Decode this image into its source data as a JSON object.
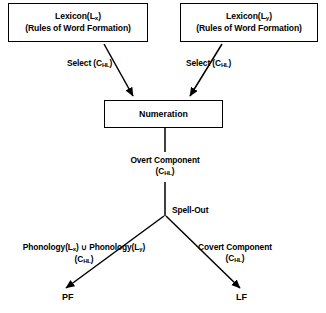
{
  "diagram": {
    "type": "flowchart",
    "background_color": "#ffffff",
    "line_color": "#000000"
  },
  "nodes": {
    "lexicon_x": {
      "line1_prefix": "Lexicon(L",
      "line1_subscript": "x",
      "line1_suffix": ")",
      "line2": "(Rules of Word Formation)"
    },
    "lexicon_y": {
      "line1_prefix": "Lexicon(L",
      "line1_subscript": "y",
      "line1_suffix": ")",
      "line2": "(Rules of Word Formation)"
    },
    "numeration": {
      "label": "Numeration"
    },
    "pf": {
      "label": "PF"
    },
    "lf": {
      "label": "LF"
    }
  },
  "labels": {
    "select_left": {
      "text_prefix": "Select (C",
      "subscript": "HL",
      "text_suffix": ")"
    },
    "select_right": {
      "text_prefix": "Select (C",
      "subscript": "HL",
      "text_suffix": ")"
    },
    "overt_component": {
      "line1": "Overt Component",
      "line2_prefix": "(C",
      "line2_subscript": "HL",
      "line2_suffix": ")"
    },
    "spell_out": {
      "text": "Spell-Out"
    },
    "phonology_union": {
      "line1_part1": "Phonology(L",
      "line1_sub1": "x",
      "line1_part2": ") ",
      "line1_union": "∪",
      "line1_part3": " Phonology(L",
      "line1_sub2": "y",
      "line1_part4": ")",
      "line2_prefix": "(C",
      "line2_subscript": "HL",
      "line2_suffix": ")"
    },
    "covert_component": {
      "line1": "Covert Component",
      "line2_prefix": "(C",
      "line2_subscript": "HL",
      "line2_suffix": ")"
    }
  },
  "edges": [
    {
      "name": "lexicon-x-to-numeration",
      "from": "lexicon_x",
      "to": "numeration",
      "style": "arrow"
    },
    {
      "name": "lexicon-y-to-numeration",
      "from": "lexicon_y",
      "to": "numeration",
      "style": "arrow"
    },
    {
      "name": "numeration-to-overt",
      "from": "numeration",
      "to": "overt_component",
      "style": "line"
    },
    {
      "name": "overt-to-spellout",
      "from": "overt_component",
      "to": "spell_out",
      "style": "line"
    },
    {
      "name": "spellout-to-pf",
      "from": "spell_out",
      "to": "pf",
      "style": "arrow"
    },
    {
      "name": "spellout-to-lf",
      "from": "spell_out",
      "to": "lf",
      "style": "arrow"
    }
  ]
}
